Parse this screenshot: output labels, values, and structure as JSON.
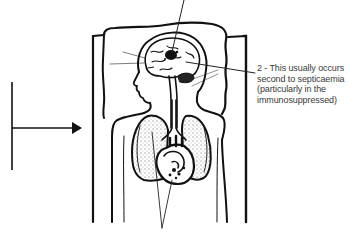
{
  "figure": {
    "callouts": [
      {
        "id": "callout-2",
        "lines": [
          "2 - This usually occurs",
          "second to septicaemia",
          "(particularly in the",
          "immunosuppressed)"
        ],
        "target": "brain"
      }
    ],
    "pointers": [
      {
        "id": "pointer-top",
        "target": "brain",
        "label_visible": false
      },
      {
        "id": "pointer-bottom",
        "target": [
          "lungs",
          "heart"
        ],
        "label_visible": false
      },
      {
        "id": "pointer-left-arrow",
        "target": "body",
        "label_visible": false
      }
    ],
    "colors": {
      "ink": "#111111",
      "text": "#3a3a3a",
      "background": "#ffffff",
      "stipple": "#555555"
    }
  }
}
